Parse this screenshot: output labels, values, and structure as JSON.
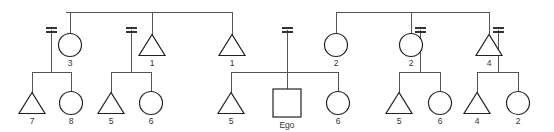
{
  "diagram": {
    "type": "kinship-pedigree-chart",
    "ego_label": "Ego",
    "symbols": {
      "triangle": "male",
      "circle": "female",
      "square": "ego-subject",
      "double-line": "marriage-union"
    },
    "colors": {
      "line": "#555555",
      "shape_stroke": "#222222",
      "shape_fill": "#ffffff",
      "label_text": "#333333",
      "background": "#ffffff"
    },
    "generations": [
      {
        "name": "generation-1",
        "nodes": [
          {
            "id": "g1-n1",
            "shape": "circle",
            "label": "3",
            "x": 70,
            "y": 45,
            "married": true,
            "marriage_side": "left"
          },
          {
            "id": "g1-n2",
            "shape": "triangle",
            "label": "1",
            "x": 152,
            "y": 45,
            "married": true,
            "marriage_side": "left"
          },
          {
            "id": "g1-n3",
            "shape": "triangle",
            "label": "1",
            "x": 232,
            "y": 45,
            "married": false,
            "marriage_side": "none"
          },
          {
            "id": "g1-n4",
            "shape": "marriage-only",
            "label": "",
            "x": 287,
            "y": 45,
            "married": true,
            "marriage_side": "center"
          },
          {
            "id": "g1-n5",
            "shape": "circle",
            "label": "2",
            "x": 336,
            "y": 45,
            "married": false,
            "marriage_side": "none"
          },
          {
            "id": "g1-n6",
            "shape": "circle",
            "label": "2",
            "x": 411,
            "y": 45,
            "married": true,
            "marriage_side": "right"
          },
          {
            "id": "g1-n7",
            "shape": "triangle",
            "label": "4",
            "x": 489,
            "y": 45,
            "married": true,
            "marriage_side": "right"
          }
        ]
      },
      {
        "name": "generation-2",
        "nodes": [
          {
            "id": "g2-n1",
            "shape": "triangle",
            "label": "7",
            "x": 32,
            "y": 103
          },
          {
            "id": "g2-n2",
            "shape": "circle",
            "label": "8",
            "x": 71,
            "y": 103
          },
          {
            "id": "g2-n3",
            "shape": "triangle",
            "label": "5",
            "x": 111,
            "y": 103
          },
          {
            "id": "g2-n4",
            "shape": "circle",
            "label": "6",
            "x": 151,
            "y": 103
          },
          {
            "id": "g2-n5",
            "shape": "triangle",
            "label": "5",
            "x": 231,
            "y": 103
          },
          {
            "id": "g2-n6",
            "shape": "square",
            "label": "Ego",
            "x": 287,
            "y": 103
          },
          {
            "id": "g2-n7",
            "shape": "circle",
            "label": "6",
            "x": 338,
            "y": 103
          },
          {
            "id": "g2-n8",
            "shape": "triangle",
            "label": "5",
            "x": 399,
            "y": 103
          },
          {
            "id": "g2-n9",
            "shape": "circle",
            "label": "6",
            "x": 440,
            "y": 103
          },
          {
            "id": "g2-n10",
            "shape": "triangle",
            "label": "4",
            "x": 477,
            "y": 103
          },
          {
            "id": "g2-n11",
            "shape": "circle",
            "label": "2",
            "x": 518,
            "y": 103
          }
        ]
      }
    ],
    "sibling_bars": [
      {
        "name": "top-sibling-bar-left",
        "x1": 66,
        "x2": 232,
        "y": 12,
        "drops": [
          70,
          152,
          232
        ]
      },
      {
        "name": "top-sibling-bar-right",
        "x1": 336,
        "x2": 489,
        "y": 12,
        "drops": [
          336,
          411,
          489
        ]
      },
      {
        "name": "children-bar-1",
        "x1": 32,
        "x2": 71,
        "y": 72,
        "parent_x": 51,
        "drops": [
          32,
          71
        ]
      },
      {
        "name": "children-bar-2",
        "x1": 111,
        "x2": 151,
        "y": 72,
        "parent_x": 131,
        "drops": [
          111,
          151
        ]
      },
      {
        "name": "children-bar-3",
        "x1": 231,
        "x2": 338,
        "y": 72,
        "parent_x": 287,
        "drops": [
          231,
          287,
          338
        ]
      },
      {
        "name": "children-bar-4",
        "x1": 399,
        "x2": 440,
        "y": 72,
        "parent_x": 420,
        "drops": [
          399,
          440
        ]
      },
      {
        "name": "children-bar-5",
        "x1": 477,
        "x2": 518,
        "y": 72,
        "parent_x": 498,
        "drops": [
          477,
          518
        ]
      }
    ],
    "marriage_lines": [
      {
        "name": "marriage-1",
        "x": 51,
        "y_top": 30,
        "y_bottom": 72
      },
      {
        "name": "marriage-2",
        "x": 131,
        "y_top": 30,
        "y_bottom": 72
      },
      {
        "name": "marriage-3",
        "x": 287,
        "y_top": 30,
        "y_bottom": 72
      },
      {
        "name": "marriage-4",
        "x": 420,
        "y_top": 30,
        "y_bottom": 72
      },
      {
        "name": "marriage-5",
        "x": 498,
        "y_top": 30,
        "y_bottom": 72
      }
    ]
  }
}
